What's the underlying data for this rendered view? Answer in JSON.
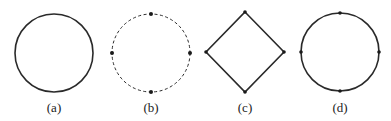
{
  "figure": {
    "stroke_color": "#2a2a2a",
    "panels": [
      {
        "id": "a",
        "label": "(a)",
        "shape": "circle",
        "style": "solid",
        "center": [
          54,
          53
        ],
        "radius": 39,
        "vertices": []
      },
      {
        "id": "b",
        "label": "(b)",
        "shape": "circle",
        "style": "dashed",
        "center": [
          151,
          53
        ],
        "radius": 39,
        "vertices": [
          "top",
          "right",
          "bottom",
          "left"
        ]
      },
      {
        "id": "c",
        "label": "(c)",
        "shape": "diamond",
        "style": "solid",
        "points": [
          [
            245,
            12
          ],
          [
            284,
            52
          ],
          [
            245,
            92
          ],
          [
            206,
            52
          ]
        ],
        "vertices": [
          "top",
          "right",
          "bottom",
          "left"
        ]
      },
      {
        "id": "d",
        "label": "(d)",
        "shape": "circle",
        "style": "solid",
        "center": [
          340,
          52
        ],
        "radius": 39,
        "vertices": [
          "top",
          "right",
          "bottom",
          "left"
        ]
      }
    ]
  }
}
